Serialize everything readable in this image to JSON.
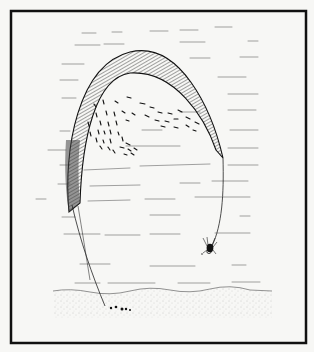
{
  "illustration": {
    "subject": "pen-and-ink drawing of a hatched arch in water with a school of fish, a spider on a thread, and pebbles on the bed",
    "colors": {
      "background": "#f7f7f5",
      "ink": "#1a1a1a",
      "frame": "#111111",
      "stipple": "#9a9a9a"
    },
    "frame": {
      "x": 10,
      "y": 10,
      "width": 297,
      "height": 334,
      "stroke_width": 2.5
    },
    "elements": [
      {
        "name": "hatched-arch",
        "label": "arch band"
      },
      {
        "name": "fish-school",
        "label": "school of fish"
      },
      {
        "name": "spider",
        "label": "spider"
      },
      {
        "name": "pebbles",
        "label": "pebbles"
      },
      {
        "name": "ground",
        "label": "stippled ground"
      },
      {
        "name": "water-lines",
        "label": "water surface dashes"
      }
    ]
  }
}
